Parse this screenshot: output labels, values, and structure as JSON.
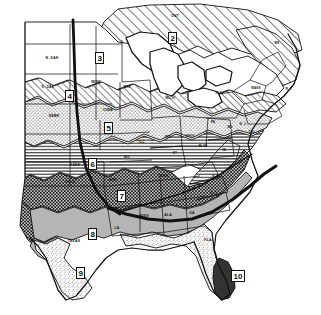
{
  "map": {
    "title": "Plant Hardiness Zone Map of the Eastern United States",
    "type": "choropleth-hardiness-zones",
    "background_color": "#ffffff",
    "ink_color": "#111111",
    "zones": [
      {
        "id": "zone-2",
        "label": "2",
        "pattern": "diagonal-hatch-wide",
        "fill": "#ffffff",
        "stroke": "#111111",
        "x": 168,
        "y": 32
      },
      {
        "id": "zone-3",
        "label": "3",
        "pattern": "blank-white",
        "fill": "#ffffff",
        "stroke": "#111111",
        "x": 95,
        "y": 52
      },
      {
        "id": "zone-4",
        "label": "4",
        "pattern": "diagonal-hatch-medium",
        "fill": "#ffffff",
        "stroke": "#111111",
        "x": 65,
        "y": 90
      },
      {
        "id": "zone-5",
        "label": "5",
        "pattern": "stipple-dots",
        "fill": "#f2f2f2",
        "stroke": "#111111",
        "x": 104,
        "y": 122
      },
      {
        "id": "zone-6",
        "label": "6",
        "pattern": "horizontal-lines",
        "fill": "#ffffff",
        "stroke": "#111111",
        "x": 88,
        "y": 158
      },
      {
        "id": "zone-7",
        "label": "7",
        "pattern": "dense-checkerboard-dark",
        "fill": "#4a4a4a",
        "stroke": "#111111",
        "x": 117,
        "y": 190
      },
      {
        "id": "zone-8",
        "label": "8",
        "pattern": "solid-gray",
        "fill": "#b9b9b9",
        "stroke": "#111111",
        "x": 88,
        "y": 228
      },
      {
        "id": "zone-9",
        "label": "9",
        "pattern": "fine-speckle-light",
        "fill": "#ededed",
        "stroke": "#111111",
        "x": 76,
        "y": 267
      },
      {
        "id": "zone-10",
        "label": "10",
        "pattern": "solid-dark",
        "fill": "#3a3a3a",
        "stroke": "#111111",
        "x": 231,
        "y": 270
      }
    ],
    "state_labels": [
      {
        "name": "ONT",
        "text": "ONT",
        "x": 175,
        "y": 16
      },
      {
        "name": "N-DAK",
        "text": "N. DAK",
        "x": 52,
        "y": 58
      },
      {
        "name": "S-DAK",
        "text": "S. DAK",
        "x": 48,
        "y": 87
      },
      {
        "name": "NEBR",
        "text": "NEBR",
        "x": 54,
        "y": 116
      },
      {
        "name": "MINN",
        "text": "MINN",
        "x": 96,
        "y": 82
      },
      {
        "name": "WIS",
        "text": "WIS",
        "x": 127,
        "y": 87
      },
      {
        "name": "IOWA",
        "text": "IOWA",
        "x": 108,
        "y": 110
      },
      {
        "name": "MICH",
        "text": "MICH",
        "x": 170,
        "y": 98
      },
      {
        "name": "ILL",
        "text": "ILL",
        "x": 142,
        "y": 142
      },
      {
        "name": "IND",
        "text": "IND",
        "x": 168,
        "y": 137
      },
      {
        "name": "OHIO",
        "text": "OHIO",
        "x": 190,
        "y": 136
      },
      {
        "name": "MO",
        "text": "MO",
        "x": 127,
        "y": 157
      },
      {
        "name": "KANS",
        "text": "KANS",
        "x": 75,
        "y": 165
      },
      {
        "name": "OKLA",
        "text": "OKLA",
        "x": 70,
        "y": 182
      },
      {
        "name": "ARK",
        "text": "ARK",
        "x": 113,
        "y": 180
      },
      {
        "name": "KY",
        "text": "KY",
        "x": 175,
        "y": 153
      },
      {
        "name": "W-VA",
        "text": "W. VA",
        "x": 203,
        "y": 146
      },
      {
        "name": "PA",
        "text": "PA",
        "x": 213,
        "y": 122
      },
      {
        "name": "N-Y",
        "text": "N. Y.",
        "x": 219,
        "y": 93
      },
      {
        "name": "MASS",
        "text": "MASS",
        "x": 256,
        "y": 88
      },
      {
        "name": "ME",
        "text": "ME",
        "x": 277,
        "y": 43
      },
      {
        "name": "R-I",
        "text": "R. I.",
        "x": 289,
        "y": 89
      },
      {
        "name": "N-J",
        "text": "N. J.",
        "x": 243,
        "y": 124
      },
      {
        "name": "MD",
        "text": "MD",
        "x": 230,
        "y": 127
      },
      {
        "name": "DEL",
        "text": "DEL",
        "x": 252,
        "y": 132
      },
      {
        "name": "VA",
        "text": "VA",
        "x": 224,
        "y": 150
      },
      {
        "name": "TENN",
        "text": "TENN",
        "x": 163,
        "y": 176
      },
      {
        "name": "N-C",
        "text": "N. C.",
        "x": 216,
        "y": 176
      },
      {
        "name": "S-C",
        "text": "S. C.",
        "x": 214,
        "y": 193
      },
      {
        "name": "GA",
        "text": "GA",
        "x": 192,
        "y": 213
      },
      {
        "name": "ALA",
        "text": "ALA",
        "x": 168,
        "y": 215
      },
      {
        "name": "MISS",
        "text": "MISS",
        "x": 144,
        "y": 216
      },
      {
        "name": "LA",
        "text": "LA",
        "x": 117,
        "y": 228
      },
      {
        "name": "TEXAS",
        "text": "TEXAS",
        "x": 74,
        "y": 241
      },
      {
        "name": "FLA",
        "text": "FLA",
        "x": 208,
        "y": 240
      }
    ],
    "boundary_lines": [
      {
        "name": "meridian-line",
        "description": "thick vertical north-south boundary line",
        "width": 2.6
      },
      {
        "name": "southern-zone-boundary",
        "description": "thick diagonal boundary sweeping from Texas across to the Carolinas coast",
        "width": 3.0
      }
    ]
  }
}
